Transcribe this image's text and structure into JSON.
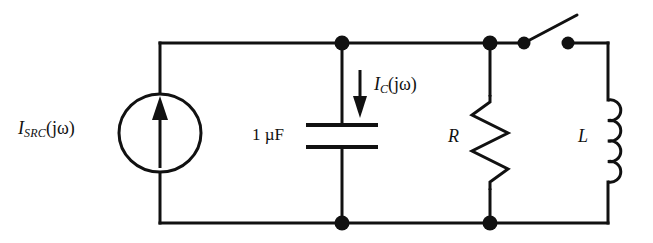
{
  "figure": {
    "name": "ac-circuit-schematic",
    "type": "electrical-schematic",
    "background_color": "#ffffff",
    "line_color": "#111111"
  },
  "labels": {
    "source_current": {
      "italic_main": "I",
      "subscript": "SRC",
      "argument": "(jω)",
      "full_text": "I_SRC(jω)"
    },
    "capacitor_value": "1 µF",
    "capacitor_current": {
      "italic_main": "I",
      "subscript": "C",
      "argument": "(jω)",
      "full_text": "I_C(jω)"
    },
    "resistor": "R",
    "inductor": "L"
  },
  "components": [
    {
      "name": "current-source",
      "symbol": "circle-with-up-arrow",
      "label": "I_SRC(jω)"
    },
    {
      "name": "capacitor",
      "symbol": "parallel-plates",
      "label": "1 µF"
    },
    {
      "name": "resistor",
      "symbol": "zigzag",
      "label": "R"
    },
    {
      "name": "switch",
      "symbol": "open-spst-switch",
      "label": ""
    },
    {
      "name": "inductor",
      "symbol": "coil",
      "label": "L"
    }
  ],
  "nodes": [
    {
      "name": "top-capacitor-node",
      "x": 342,
      "y": 43
    },
    {
      "name": "bottom-capacitor-node",
      "x": 342,
      "y": 223
    },
    {
      "name": "top-resistor-node",
      "x": 490,
      "y": 43
    },
    {
      "name": "bottom-resistor-node",
      "x": 490,
      "y": 223
    },
    {
      "name": "switch-pivot-terminal",
      "x": 524,
      "y": 43
    },
    {
      "name": "switch-open-terminal",
      "x": 568,
      "y": 43
    }
  ],
  "annotations": {
    "capacitor_current_arrow_direction": "down"
  }
}
